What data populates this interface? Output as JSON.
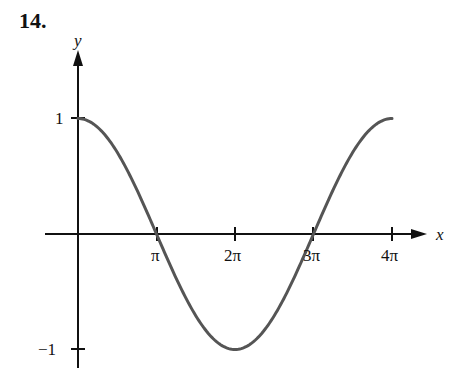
{
  "problem_number": "14.",
  "chart_data": {
    "type": "line",
    "title": "",
    "function": "y = cos(x/2)",
    "xlabel": "x",
    "ylabel": "y",
    "x_ticks": [
      "π",
      "2π",
      "3π",
      "4π"
    ],
    "y_ticks": [
      "1",
      "−1"
    ],
    "xlim": [
      0,
      12.566
    ],
    "ylim": [
      -1,
      1
    ],
    "grid": false,
    "series": [
      {
        "name": "cos(x/2)",
        "color": "#555555",
        "x": [
          0,
          1.5708,
          3.1416,
          4.7124,
          6.2832,
          7.854,
          9.4248,
          10.9956,
          12.5664
        ],
        "values": [
          1,
          0.7071,
          0,
          -0.7071,
          -1,
          -0.7071,
          0,
          0.7071,
          1
        ]
      }
    ]
  },
  "axis_labels": {
    "x": "x",
    "y": "y",
    "x_ticks": [
      "π",
      "2π",
      "3π",
      "4π"
    ],
    "y_tick_top": "1",
    "y_tick_bottom": "−1"
  }
}
